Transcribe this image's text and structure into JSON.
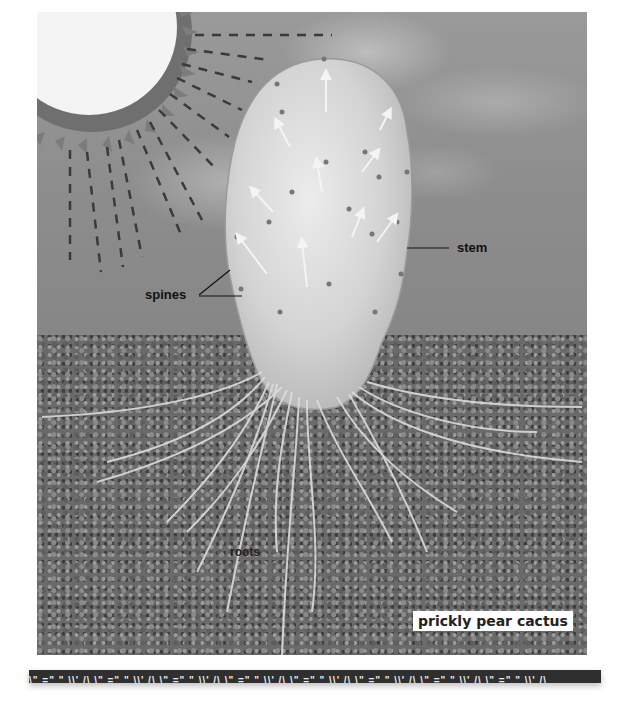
{
  "diagram": {
    "title": "prickly pear cactus",
    "labels": {
      "stem": "stem",
      "spines": "spines",
      "roots": "roots"
    },
    "caption": "prickly pear cactus",
    "elements": [
      "sun",
      "sun-rays",
      "clouds",
      "cactus-pad",
      "spine-arrows",
      "soil",
      "roots",
      "decorative-strip"
    ],
    "decorative_strip_pattern": "\\\" =\" \" \\\\' /\\ \\\" =\" \" \\\\' /\\ \\\" =\" \" \\\\' /\\ \\\" =\" \" \\\\' /\\ \\\" =\" \" \\\\' /\\ \\\" =\" \" \\\\' /\\ \\\" =\" \" \\\\' /\\ \\\" =\" \" \\\\' /\\",
    "colors": {
      "sky": "#8e8e8e",
      "sun": "#f2f2f2",
      "soil": "#6a6a6a",
      "cactus": "#d9d9d9",
      "label_text": "#111111",
      "strip": "#2f2f2f"
    }
  }
}
